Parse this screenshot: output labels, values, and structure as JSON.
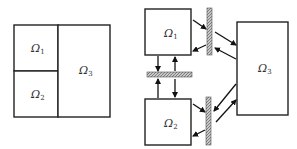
{
  "left_figure": {
    "regions": [
      {
        "id": "omega1",
        "symbol": "Ω",
        "subscript": "1"
      },
      {
        "id": "omega2",
        "symbol": "Ω",
        "subscript": "2"
      },
      {
        "id": "omega3",
        "symbol": "Ω",
        "subscript": "3"
      }
    ]
  },
  "right_figure": {
    "regions": [
      {
        "id": "omega1",
        "symbol": "Ω",
        "subscript": "1"
      },
      {
        "id": "omega2",
        "symbol": "Ω",
        "subscript": "2"
      },
      {
        "id": "omega3",
        "symbol": "Ω",
        "subscript": "3"
      }
    ],
    "interfaces": [
      {
        "id": "interface-1-3",
        "between": [
          "omega1",
          "omega3"
        ],
        "orientation": "vertical"
      },
      {
        "id": "interface-2-3",
        "between": [
          "omega2",
          "omega3"
        ],
        "orientation": "vertical"
      },
      {
        "id": "interface-1-2",
        "between": [
          "omega1",
          "omega2"
        ],
        "orientation": "horizontal"
      }
    ]
  },
  "colors": {
    "line": "#222222",
    "hatch": "#9a9a9a",
    "background": "#ffffff"
  }
}
